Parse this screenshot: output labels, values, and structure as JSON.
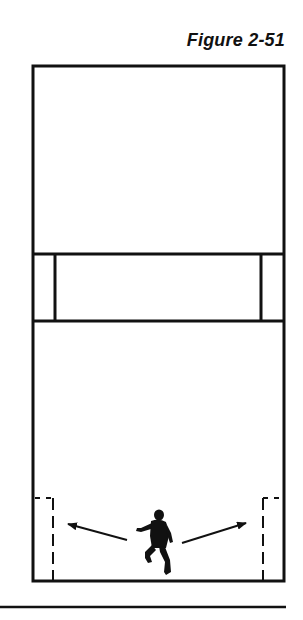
{
  "figure": {
    "title": "Figure 2-51"
  },
  "diagram": {
    "type": "racquetball-court-overhead",
    "colors": {
      "line": "#111111",
      "background": "#ffffff"
    },
    "court": {
      "outer": {
        "x1": 33,
        "y1": 66,
        "x2": 284,
        "y2": 581
      },
      "service_line_y": 254,
      "short_line_y": 321,
      "service_box_left_x": 55,
      "service_box_right_x": 261
    },
    "doubles_boxes": {
      "left_x": 52,
      "right_x": 263,
      "top_y": 497,
      "bottom_y": 581,
      "style": "dashed"
    },
    "arrows": [
      {
        "name": "arrow-left",
        "from": [
          127,
          540
        ],
        "to": [
          68,
          524
        ]
      },
      {
        "name": "arrow-right",
        "from": [
          182,
          543
        ],
        "to": [
          246,
          523
        ]
      }
    ],
    "player": {
      "name": "player-silhouette",
      "center": [
        156,
        540
      ]
    },
    "baseline_rule": {
      "x1": 0,
      "x2": 286,
      "y": 607
    }
  }
}
